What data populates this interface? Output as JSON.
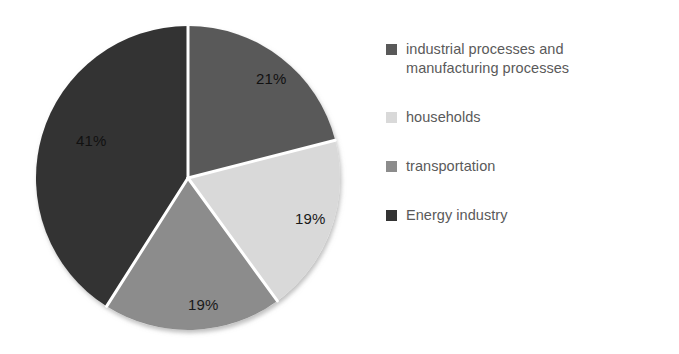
{
  "chart_data": {
    "type": "pie",
    "title": "",
    "subtitle": "",
    "xlabel": "",
    "ylabel": "",
    "grid": false,
    "legend_position": "right",
    "start_angle_deg": 0,
    "direction": "clockwise",
    "categories": [
      "industrial processes and manufacturing processes",
      "households",
      "transportation",
      "Energy industry"
    ],
    "values": [
      21,
      19,
      19,
      41
    ],
    "value_labels": [
      "21%",
      "19%",
      "19%",
      "41%"
    ],
    "colors": [
      "#595959",
      "#d9d9d9",
      "#8c8c8c",
      "#333333"
    ],
    "slices": [
      {
        "label": "industrial processes and manufacturing processes",
        "value": 21,
        "value_label": "21%",
        "color": "#595959",
        "start_deg": 0,
        "end_deg": 75.6,
        "label_on": "dark"
      },
      {
        "label": "households",
        "value": 19,
        "value_label": "19%",
        "color": "#d9d9d9",
        "start_deg": 75.6,
        "end_deg": 144.0,
        "label_on": "light"
      },
      {
        "label": "transportation",
        "value": 19,
        "value_label": "19%",
        "color": "#8c8c8c",
        "start_deg": 144.0,
        "end_deg": 212.4,
        "label_on": "light"
      },
      {
        "label": "Energy industry",
        "value": 41,
        "value_label": "41%",
        "color": "#333333",
        "start_deg": 212.4,
        "end_deg": 360.0,
        "label_on": "dark"
      }
    ]
  },
  "pie": {
    "center_x": 160,
    "center_y": 166,
    "radius": 152,
    "separator_color": "#ffffff",
    "separator_width": 3,
    "labels": [
      {
        "text": "21%",
        "x": 228,
        "y": 72,
        "on": "dark"
      },
      {
        "text": "19%",
        "x": 267,
        "y": 212,
        "on": "light"
      },
      {
        "text": "19%",
        "x": 160,
        "y": 298,
        "on": "light"
      },
      {
        "text": "41%",
        "x": 48,
        "y": 134,
        "on": "dark"
      }
    ]
  },
  "legend": {
    "items": [
      {
        "label": "industrial processes and manufacturing processes",
        "color": "#595959",
        "swatch_name": "legend-swatch-industrial"
      },
      {
        "label": "households",
        "color": "#d9d9d9",
        "swatch_name": "legend-swatch-households"
      },
      {
        "label": "transportation",
        "color": "#8c8c8c",
        "swatch_name": "legend-swatch-transportation"
      },
      {
        "label": "Energy industry",
        "color": "#333333",
        "swatch_name": "legend-swatch-energy"
      }
    ]
  }
}
